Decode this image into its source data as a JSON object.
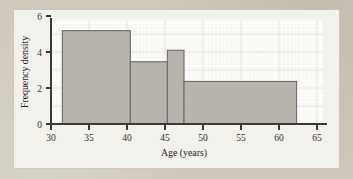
{
  "figure": {
    "background_color": "#cfc9bd",
    "card_color": "#f3f1ec",
    "plot_color": "#fdfdfb",
    "bar_fill": "#b3b0aa",
    "bar_stroke": "#6e6c68",
    "axis_color": "#3a3a3a"
  },
  "chart_data": {
    "type": "bar",
    "chart_subtype": "histogram",
    "title": "",
    "xlabel": "Age (years)",
    "ylabel": "Frequency density",
    "xlim": [
      30,
      66
    ],
    "ylim": [
      0,
      6.35
    ],
    "xticks": [
      30,
      35,
      40,
      45,
      50,
      55,
      60,
      65
    ],
    "xticklabels": [
      "30",
      "35",
      "40",
      "45",
      "50",
      "55",
      "60",
      "65"
    ],
    "yticks": [
      0,
      2,
      4,
      6
    ],
    "yticklabels": [
      "0",
      "2",
      "4",
      "6"
    ],
    "grid": true,
    "legend": null,
    "bin_edges": [
      31.5,
      40.5,
      45.4,
      47.6,
      62.5
    ],
    "bins": [
      {
        "label": "31.5-40.5",
        "x0": 31.5,
        "x1": 40.5,
        "density": 5.7
      },
      {
        "label": "40.5-45.4",
        "x0": 40.5,
        "x1": 45.4,
        "density": 3.8
      },
      {
        "label": "45.4-47.6",
        "x0": 45.4,
        "x1": 47.6,
        "density": 4.5
      },
      {
        "label": "47.6-62.5",
        "x0": 47.6,
        "x1": 62.5,
        "density": 2.6
      }
    ],
    "categories": [
      "31.5-40.5",
      "40.5-45.4",
      "45.4-47.6",
      "47.6-62.5"
    ],
    "values": [
      5.7,
      3.8,
      4.5,
      2.6
    ]
  }
}
